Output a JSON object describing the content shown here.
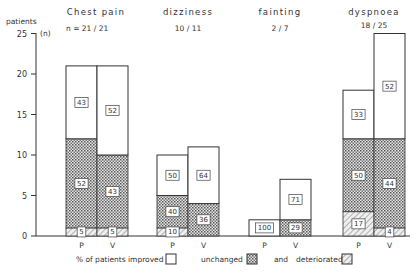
{
  "chart_data": {
    "type": "bar",
    "subtype": "stacked-percent-labeled",
    "ylabel": "patients",
    "yunit": "(n)",
    "ylim": [
      0,
      25
    ],
    "yticks": [
      0,
      5,
      10,
      15,
      20,
      25
    ],
    "bar_labels": [
      "P",
      "V"
    ],
    "groups": [
      {
        "name": "Chest pain",
        "n_label": "n = 21 / 21",
        "bars": [
          {
            "label": "P",
            "total": 21,
            "deteriorated_n": 1,
            "unchanged_n": 11,
            "improved_n": 9,
            "pct": {
              "deteriorated": "5",
              "unchanged": "52",
              "improved": "43"
            }
          },
          {
            "label": "V",
            "total": 21,
            "deteriorated_n": 1,
            "unchanged_n": 9,
            "improved_n": 11,
            "pct": {
              "deteriorated": "5",
              "unchanged": "43",
              "improved": "52"
            }
          }
        ]
      },
      {
        "name": "dizziness",
        "n_label": "10 / 11",
        "bars": [
          {
            "label": "P",
            "total": 10,
            "deteriorated_n": 1,
            "unchanged_n": 4,
            "improved_n": 5,
            "pct": {
              "deteriorated": "10",
              "unchanged": "40",
              "improved": "50"
            }
          },
          {
            "label": "V",
            "total": 11,
            "deteriorated_n": 0,
            "unchanged_n": 4,
            "improved_n": 7,
            "pct": {
              "deteriorated": "",
              "unchanged": "36",
              "improved": "64"
            }
          }
        ]
      },
      {
        "name": "fainting",
        "n_label": "2 / 7",
        "bars": [
          {
            "label": "P",
            "total": 2,
            "deteriorated_n": 0,
            "unchanged_n": 0,
            "improved_n": 2,
            "pct": {
              "deteriorated": "",
              "unchanged": "",
              "improved": "100"
            }
          },
          {
            "label": "V",
            "total": 7,
            "deteriorated_n": 0,
            "unchanged_n": 2,
            "improved_n": 5,
            "pct": {
              "deteriorated": "",
              "unchanged": "29",
              "improved": "71"
            }
          }
        ]
      },
      {
        "name": "dyspnoea",
        "n_label": "18 / 25",
        "bars": [
          {
            "label": "P",
            "total": 18,
            "deteriorated_n": 3,
            "unchanged_n": 9,
            "improved_n": 6,
            "pct": {
              "deteriorated": "17",
              "unchanged": "50",
              "improved": "33"
            }
          },
          {
            "label": "V",
            "total": 25,
            "deteriorated_n": 1,
            "unchanged_n": 11,
            "improved_n": 13,
            "pct": {
              "deteriorated": "4",
              "unchanged": "44",
              "improved": "52"
            }
          }
        ]
      }
    ],
    "legend": {
      "prefix": "% of patients",
      "improved": "improved",
      "unchanged": "unchanged",
      "and": "and",
      "deteriorated": "deteriorated"
    }
  }
}
